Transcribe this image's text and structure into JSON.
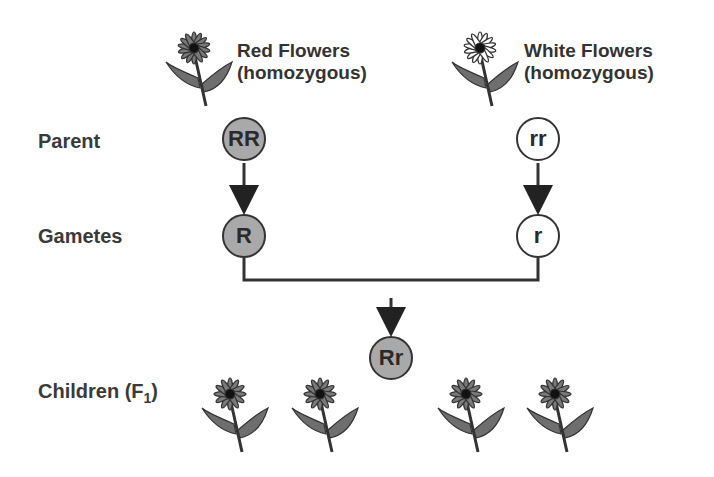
{
  "diagram": {
    "parents_header": {
      "left": {
        "line1": "Red Flowers",
        "line2": "(homozygous)",
        "flower": "red-flower-icon",
        "color": "#7a7a7a"
      },
      "right": {
        "line1": "White Flowers",
        "line2": "(homozygous)",
        "flower": "white-flower-icon",
        "color": "#ffffff"
      }
    },
    "rows": {
      "parent": "Parent",
      "gametes": "Gametes",
      "children": "Children (F",
      "children_sub": "1",
      "children_close": ")"
    },
    "genotypes": {
      "parent_left": "RR",
      "parent_right": "rr",
      "gamete_left": "R",
      "gamete_right": "r",
      "offspring": "Rr"
    },
    "colors": {
      "dominant_fill": "#a9a9a9",
      "recessive_fill": "#ffffff",
      "stroke": "#333333"
    },
    "offspring_count": 4
  }
}
